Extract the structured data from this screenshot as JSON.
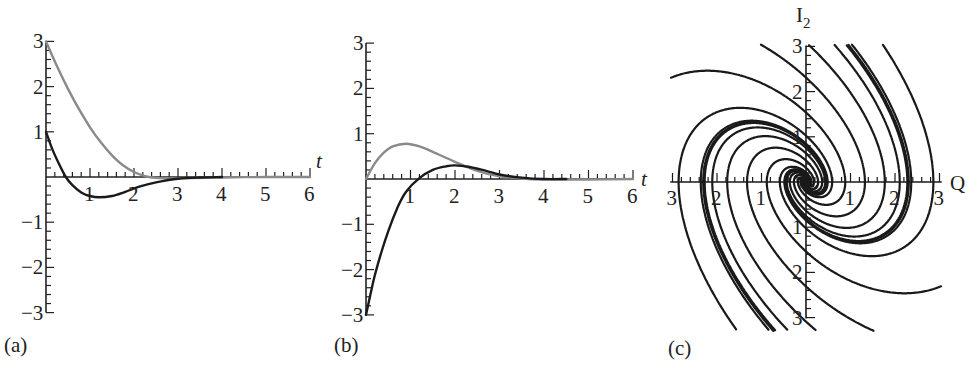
{
  "chart_data": [
    {
      "id": "a",
      "type": "line",
      "panel_label": "(a)",
      "xlabel": "t",
      "ylabel": "",
      "xlim": [
        0,
        6
      ],
      "ylim": [
        -3,
        3
      ],
      "x_ticks": [
        1,
        2,
        3,
        4,
        5,
        6
      ],
      "y_ticks": [
        -3,
        -2,
        -1,
        1,
        2,
        3
      ],
      "x_tick_labels": [
        "1",
        "2",
        "3",
        "4",
        "5",
        "6"
      ],
      "y_tick_labels": [
        "−3",
        "−2",
        "−1",
        "1",
        "2",
        "3"
      ],
      "grid": false,
      "series": [
        {
          "name": "gray curve",
          "color": "#8a8a8a",
          "x": [
            0,
            0.25,
            0.5,
            0.75,
            1.0,
            1.25,
            1.5,
            1.75,
            2.0,
            2.25,
            2.5,
            3.0,
            4.0,
            5.0,
            6.0
          ],
          "y": [
            3.0,
            2.45,
            1.95,
            1.5,
            1.1,
            0.76,
            0.48,
            0.26,
            0.11,
            0.02,
            -0.02,
            -0.03,
            -0.01,
            0.0,
            0.0
          ]
        },
        {
          "name": "black curve",
          "color": "#1a1a1a",
          "x": [
            0,
            0.15,
            0.3,
            0.45,
            0.6,
            0.8,
            1.0,
            1.2,
            1.5,
            1.8,
            2.1,
            2.5,
            3.0,
            3.5,
            4.0
          ],
          "y": [
            1.0,
            0.6,
            0.28,
            0.0,
            -0.18,
            -0.34,
            -0.42,
            -0.45,
            -0.42,
            -0.33,
            -0.22,
            -0.12,
            -0.04,
            -0.01,
            0.0
          ]
        }
      ]
    },
    {
      "id": "b",
      "type": "line",
      "panel_label": "(b)",
      "xlabel": "t",
      "ylabel": "",
      "xlim": [
        0,
        6
      ],
      "ylim": [
        -3,
        3
      ],
      "x_ticks": [
        1,
        2,
        3,
        4,
        5,
        6
      ],
      "y_ticks": [
        -3,
        -2,
        -1,
        1,
        2,
        3
      ],
      "x_tick_labels": [
        "1",
        "2",
        "3",
        "4",
        "5",
        "6"
      ],
      "y_tick_labels": [
        "−3",
        "−2",
        "−1",
        "1",
        "2",
        "3"
      ],
      "grid": false,
      "series": [
        {
          "name": "gray curve",
          "color": "#8a8a8a",
          "x": [
            0,
            0.2,
            0.4,
            0.6,
            0.9,
            1.2,
            1.5,
            2.0,
            2.5,
            3.0,
            3.5,
            4.0,
            5.0,
            6.0
          ],
          "y": [
            0.0,
            0.35,
            0.58,
            0.72,
            0.78,
            0.72,
            0.6,
            0.38,
            0.18,
            0.06,
            0.01,
            -0.01,
            -0.01,
            0.0
          ]
        },
        {
          "name": "black curve",
          "color": "#1a1a1a",
          "x": [
            0,
            0.1,
            0.2,
            0.35,
            0.5,
            0.7,
            0.9,
            1.2,
            1.5,
            1.8,
            2.0,
            2.3,
            2.7,
            3.0,
            3.5,
            4.0,
            4.5
          ],
          "y": [
            -3.0,
            -2.55,
            -2.12,
            -1.6,
            -1.15,
            -0.65,
            -0.28,
            0.02,
            0.2,
            0.28,
            0.3,
            0.27,
            0.18,
            0.1,
            0.03,
            0.0,
            0.0
          ]
        }
      ]
    },
    {
      "id": "c",
      "type": "line",
      "subtype": "phase-portrait",
      "panel_label": "(c)",
      "xlabel": "Q",
      "ylabel": "I₂",
      "ylabel_main": "I",
      "ylabel_sub": "2",
      "xlim": [
        -3,
        3
      ],
      "ylim": [
        -3,
        3
      ],
      "x_ticks": [
        -3,
        -2,
        -1,
        1,
        2,
        3
      ],
      "y_ticks": [
        -3,
        -2,
        -1,
        1,
        2,
        3
      ],
      "x_tick_labels": [
        "3",
        "2",
        "1",
        "1",
        "2",
        "3"
      ],
      "y_tick_labels": [
        "3",
        "2",
        "1",
        "1",
        "2",
        "3"
      ],
      "grid": false,
      "description": "Spiral sink: 16 trajectories spiralling clockwise into the origin",
      "system": {
        "a": 0.0,
        "b": 1.0,
        "c": -1.0,
        "d": -0.9
      },
      "trajectory_count": 16,
      "trajectory_color": "#1a1a1a"
    }
  ],
  "panels": {
    "a": {
      "label": "(a)",
      "axis_var": "t"
    },
    "b": {
      "label": "(b)",
      "axis_var": "t"
    },
    "c": {
      "label": "(c)",
      "x_var": "Q",
      "y_var_main": "I",
      "y_var_sub": "2"
    }
  }
}
